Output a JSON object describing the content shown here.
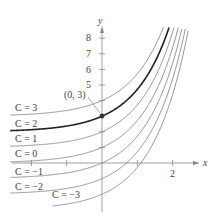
{
  "chart_data": {
    "type": "line",
    "title": "",
    "xlabel": "x",
    "ylabel": "y",
    "function": "y = e^x + C",
    "x_ticks": [
      -2,
      -1,
      0,
      1,
      2
    ],
    "x_tick_labels_shown": [
      "2"
    ],
    "y_ticks": [
      1,
      2,
      3,
      4,
      5,
      6,
      7,
      8
    ],
    "y_tick_labels_shown": [
      "5",
      "6",
      "7",
      "8"
    ],
    "xlim": [
      -2.8,
      2.9
    ],
    "ylim": [
      -4,
      9
    ],
    "series": [
      {
        "name": "C = 3",
        "C": 3,
        "highlight": false
      },
      {
        "name": "C = 2",
        "C": 2,
        "highlight": true
      },
      {
        "name": "C = 1",
        "C": 1,
        "highlight": false
      },
      {
        "name": "C = 0",
        "C": 0,
        "highlight": false
      },
      {
        "name": "C = -1",
        "C": -1,
        "highlight": false
      },
      {
        "name": "C = -2",
        "C": -2,
        "highlight": false
      },
      {
        "name": "C = -3",
        "C": -3,
        "highlight": false
      }
    ],
    "annotations": [
      {
        "text": "(0, 3)",
        "x": 0,
        "y": 3
      }
    ]
  },
  "labels": {
    "x_axis": "x",
    "y_axis": "y",
    "point": "(0, 3)",
    "y5": "5",
    "y6": "6",
    "y7": "7",
    "y8": "8",
    "x2": "2",
    "c3": "C = 3",
    "c2": "C = 2",
    "c1": "C = 1",
    "c0": "C = 0",
    "cm1": "C = −1",
    "cm2": "C = −2",
    "cm3": "C = −3"
  }
}
